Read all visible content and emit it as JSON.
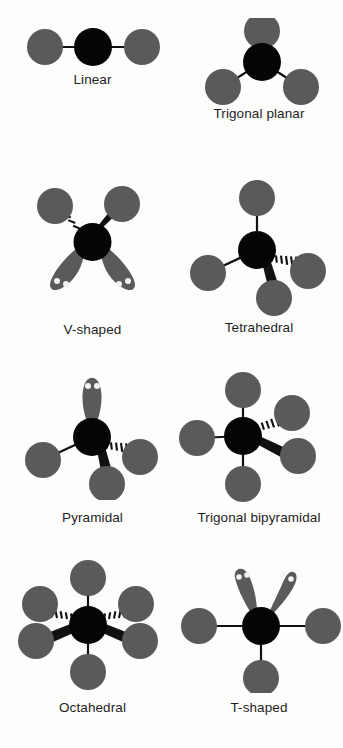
{
  "figure": {
    "background_color": "#fdfdfc",
    "central_atom_color": "#050505",
    "terminal_atom_color": "#5a5a5a",
    "lone_pair_lobe_color": "#5a5a5a",
    "lone_pair_dot_color": "#f2f2f2",
    "bond_color": "#111111",
    "label_color": "#1d1d1d"
  },
  "shapes": [
    {
      "id": "linear",
      "label": "Linear",
      "bond_count": 2,
      "lone_pair_count": 0,
      "bond_types": [
        "plain",
        "plain"
      ],
      "label_left": 0,
      "label_top": 72,
      "label_width": 185
    },
    {
      "id": "trigonal-planar",
      "label": "Trigonal planar",
      "bond_count": 3,
      "lone_pair_count": 0,
      "bond_types": [
        "plain",
        "plain",
        "plain"
      ],
      "label_left": 175,
      "label_top": 106,
      "label_width": 168
    },
    {
      "id": "v-shaped",
      "label": "V-shaped",
      "bond_count": 2,
      "lone_pair_count": 2,
      "bond_types": [
        "hashed",
        "wedge"
      ],
      "label_left": 0,
      "label_top": 322,
      "label_width": 185
    },
    {
      "id": "tetrahedral",
      "label": "Tetrahedral",
      "bond_count": 4,
      "lone_pair_count": 0,
      "bond_types": [
        "plain",
        "plain",
        "hashed",
        "wedge"
      ],
      "label_left": 175,
      "label_top": 320,
      "label_width": 168
    },
    {
      "id": "pyramidal",
      "label": "Pyramidal",
      "bond_count": 3,
      "lone_pair_count": 1,
      "bond_types": [
        "plain",
        "hashed",
        "wedge"
      ],
      "label_left": 0,
      "label_top": 510,
      "label_width": 185
    },
    {
      "id": "trigonal-bipyramidal",
      "label": "Trigonal bipyramidal",
      "bond_count": 5,
      "lone_pair_count": 0,
      "bond_types": [
        "plain",
        "plain",
        "plain",
        "hashed",
        "wedge"
      ],
      "label_left": 175,
      "label_top": 510,
      "label_width": 168
    },
    {
      "id": "octahedral",
      "label": "Octahedral",
      "bond_count": 6,
      "lone_pair_count": 0,
      "bond_types": [
        "plain",
        "plain",
        "hashed",
        "hashed",
        "wedge",
        "wedge"
      ],
      "label_left": 0,
      "label_top": 700,
      "label_width": 185
    },
    {
      "id": "t-shaped",
      "label": "T-shaped",
      "bond_count": 3,
      "lone_pair_count": 2,
      "bond_types": [
        "plain",
        "plain",
        "plain"
      ],
      "label_left": 175,
      "label_top": 700,
      "label_width": 168
    }
  ]
}
